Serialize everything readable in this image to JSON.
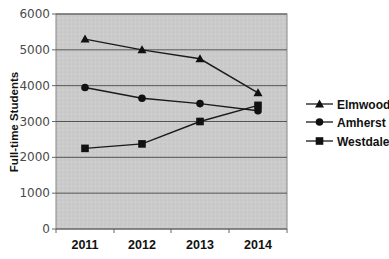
{
  "chart_data": {
    "type": "line",
    "title": "",
    "xlabel": "",
    "ylabel": "Full-time Students",
    "categories": [
      "2011",
      "2012",
      "2013",
      "2014"
    ],
    "ylim": [
      0,
      6000
    ],
    "yticks": [
      0,
      1000,
      2000,
      3000,
      4000,
      5000,
      6000
    ],
    "grid": true,
    "legend_position": "right",
    "series": [
      {
        "name": "Elmwood",
        "marker": "triangle",
        "values": [
          5300,
          5000,
          4750,
          3800
        ]
      },
      {
        "name": "Amherst",
        "marker": "circle",
        "values": [
          3950,
          3650,
          3500,
          3300
        ]
      },
      {
        "name": "Westdale",
        "marker": "square",
        "values": [
          2250,
          2375,
          3000,
          3450
        ]
      }
    ]
  },
  "colors": {
    "plot_background": "#c9c9c9",
    "gridline": "#555555",
    "series_line": "#1a1a1a"
  }
}
